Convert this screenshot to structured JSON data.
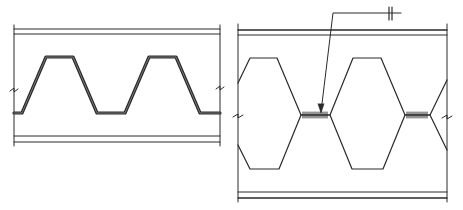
{
  "diagram": {
    "colors": {
      "line": "#2a2a2a",
      "background": "#ffffff"
    },
    "left_panel": {
      "name": "trapezoidal-corrugated-web",
      "frame": {
        "x1": 14,
        "x2": 220
      },
      "top_flange_lines_y": [
        29,
        34
      ],
      "bottom_flange_lines_y": [
        136,
        142
      ],
      "wave_points": "14,113 22,113 46,57 73,57 97,113 125,113 149,57 176,57 200,113 220,113"
    },
    "right_panel": {
      "name": "castellated-hexagonal-web",
      "frame": {
        "x1": 238,
        "x2": 447
      },
      "top_flange_lines_y": [
        30,
        35
      ],
      "bottom_flange_lines_y": [
        192,
        198
      ],
      "weld_label": "welded joints",
      "leader_annotation_symbol": "||"
    }
  }
}
